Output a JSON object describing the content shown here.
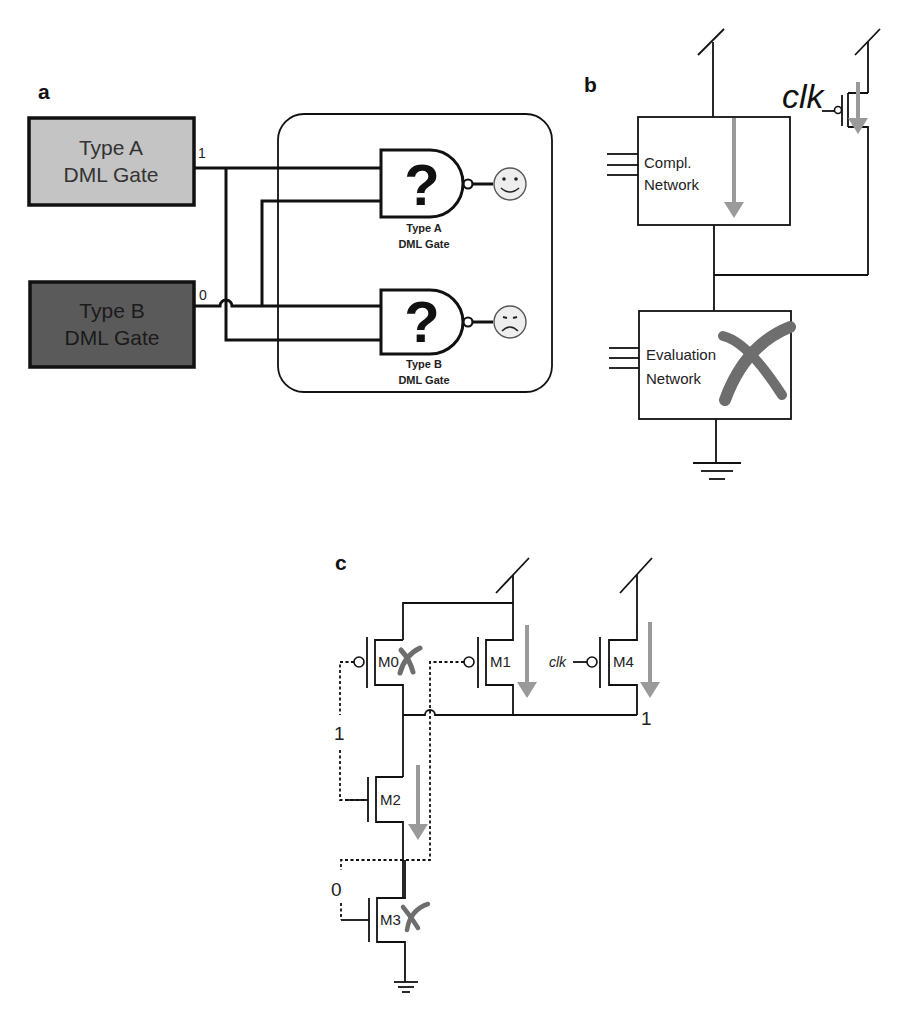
{
  "panels": {
    "a": {
      "label": "a",
      "type_a_box": {
        "line1": "Type A",
        "line2": "DML Gate",
        "fill": "#c4c4c4",
        "output_value": "1"
      },
      "type_b_box": {
        "line1": "Type B",
        "line2": "DML Gate",
        "fill": "#5a5a5a",
        "output_value": "0"
      },
      "gate_a": {
        "symbol": "?",
        "caption1": "Type A",
        "caption2": "DML Gate",
        "outcome_icon": "happy-face-icon"
      },
      "gate_b": {
        "symbol": "?",
        "caption1": "Type B",
        "caption2": "DML Gate",
        "outcome_icon": "sad-face-icon"
      }
    },
    "b": {
      "label": "b",
      "clk_label": "clk",
      "compl_network": {
        "line1": "Compl.",
        "line2": "Network"
      },
      "eval_network": {
        "line1": "Evaluation",
        "line2": "Network",
        "disabled_mark": "x-mark-icon"
      }
    },
    "c": {
      "label": "c",
      "transistors": [
        {
          "name": "M0",
          "type": "pmos",
          "disabled": true
        },
        {
          "name": "M1",
          "type": "pmos",
          "disabled": false
        },
        {
          "name": "M4",
          "type": "pmos",
          "disabled": false
        },
        {
          "name": "M2",
          "type": "nmos",
          "disabled": false
        },
        {
          "name": "M3",
          "type": "nmos",
          "disabled": true
        }
      ],
      "clk_label": "clk",
      "output_value": "1",
      "input_value_top": "1",
      "input_value_bottom": "0"
    }
  },
  "colors": {
    "wire": "#111111",
    "current_arrow": "#9a9a9a",
    "x_mark": "#6e6e6e",
    "face_fill": "#eeeeee"
  }
}
